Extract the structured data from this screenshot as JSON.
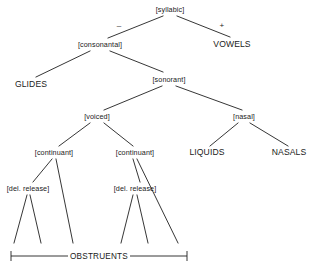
{
  "diagram": {
    "type": "binary-feature-tree",
    "line_color": "#1f1f1f",
    "text_color": "#1a1a1a",
    "background": "#ffffff",
    "nodes": [
      {
        "id": "syllabic",
        "label": "[syllabic]",
        "kind": "feature",
        "x": 170,
        "y": 9
      },
      {
        "id": "consonantal",
        "label": "[consonantal]",
        "kind": "feature",
        "x": 100,
        "y": 44
      },
      {
        "id": "vowels",
        "label": "VOWELS",
        "kind": "terminal",
        "x": 232,
        "y": 44
      },
      {
        "id": "glides",
        "label": "GLIDES",
        "kind": "terminal",
        "x": 31,
        "y": 84
      },
      {
        "id": "sonorant",
        "label": "[sonorant]",
        "kind": "feature",
        "x": 169,
        "y": 79
      },
      {
        "id": "voiced",
        "label": "[voiced]",
        "kind": "feature",
        "x": 97,
        "y": 116
      },
      {
        "id": "nasal",
        "label": "[nasal]",
        "kind": "feature",
        "x": 244,
        "y": 116
      },
      {
        "id": "continuant-1",
        "label": "[continuant]",
        "kind": "feature",
        "x": 54,
        "y": 152
      },
      {
        "id": "continuant-2",
        "label": "[continuant]",
        "kind": "feature",
        "x": 135,
        "y": 152
      },
      {
        "id": "liquids",
        "label": "LIQUIDS",
        "kind": "terminal",
        "x": 207,
        "y": 152
      },
      {
        "id": "nasals",
        "label": "NASALS",
        "kind": "terminal",
        "x": 289,
        "y": 152
      },
      {
        "id": "del-release-1",
        "label": "[del. release]",
        "kind": "feature",
        "x": 28,
        "y": 188
      },
      {
        "id": "del-release-2",
        "label": "[del. release]",
        "kind": "feature",
        "x": 135,
        "y": 188
      }
    ],
    "branch_values": [
      {
        "id": "syllabic-minus",
        "label": "–",
        "x": 119,
        "y": 25
      },
      {
        "id": "syllabic-plus",
        "label": "+",
        "x": 222,
        "y": 25
      }
    ],
    "edges": [
      {
        "from": "syllabic",
        "to": "consonantal",
        "x1": 163,
        "y1": 16,
        "x2": 108,
        "y2": 38
      },
      {
        "from": "syllabic",
        "to": "vowels",
        "x1": 177,
        "y1": 16,
        "x2": 230,
        "y2": 37
      },
      {
        "from": "consonantal",
        "to": "glides",
        "x1": 90,
        "y1": 51,
        "x2": 36,
        "y2": 77
      },
      {
        "from": "consonantal",
        "to": "sonorant",
        "x1": 110,
        "y1": 51,
        "x2": 163,
        "y2": 72
      },
      {
        "from": "sonorant",
        "to": "voiced",
        "x1": 162,
        "y1": 86,
        "x2": 104,
        "y2": 110
      },
      {
        "from": "sonorant",
        "to": "nasal",
        "x1": 176,
        "y1": 86,
        "x2": 242,
        "y2": 110
      },
      {
        "from": "voiced",
        "to": "continuant-1",
        "x1": 90,
        "y1": 123,
        "x2": 59,
        "y2": 146
      },
      {
        "from": "voiced",
        "to": "continuant-2",
        "x1": 104,
        "y1": 123,
        "x2": 133,
        "y2": 146
      },
      {
        "from": "nasal",
        "to": "liquids",
        "x1": 238,
        "y1": 123,
        "x2": 210,
        "y2": 146
      },
      {
        "from": "nasal",
        "to": "nasals",
        "x1": 250,
        "y1": 123,
        "x2": 288,
        "y2": 146
      },
      {
        "from": "continuant-1",
        "to": "del-release-1",
        "x1": 52,
        "y1": 159,
        "x2": 33,
        "y2": 182
      },
      {
        "from": "continuant-1",
        "to": "leaf-3",
        "x1": 56,
        "y1": 159,
        "x2": 73,
        "y2": 243
      },
      {
        "from": "continuant-2",
        "to": "del-release-2",
        "x1": 133,
        "y1": 159,
        "x2": 140,
        "y2": 182
      },
      {
        "from": "continuant-2",
        "to": "leaf-6",
        "x1": 137,
        "y1": 159,
        "x2": 178,
        "y2": 243
      },
      {
        "from": "del-release-1",
        "to": "leaf-1",
        "x1": 27,
        "y1": 195,
        "x2": 14,
        "y2": 243
      },
      {
        "from": "del-release-1",
        "to": "leaf-2",
        "x1": 30,
        "y1": 195,
        "x2": 41,
        "y2": 243
      },
      {
        "from": "del-release-2",
        "to": "leaf-4",
        "x1": 133,
        "y1": 195,
        "x2": 121,
        "y2": 243
      },
      {
        "from": "del-release-2",
        "to": "leaf-5",
        "x1": 137,
        "y1": 195,
        "x2": 148,
        "y2": 243
      }
    ],
    "bracket": {
      "id": "obstruents-bracket",
      "label": "OBSTRUENTS",
      "y": 256,
      "x_start": 11,
      "x_end": 187,
      "tick_height": 5,
      "label_x": 99
    }
  }
}
